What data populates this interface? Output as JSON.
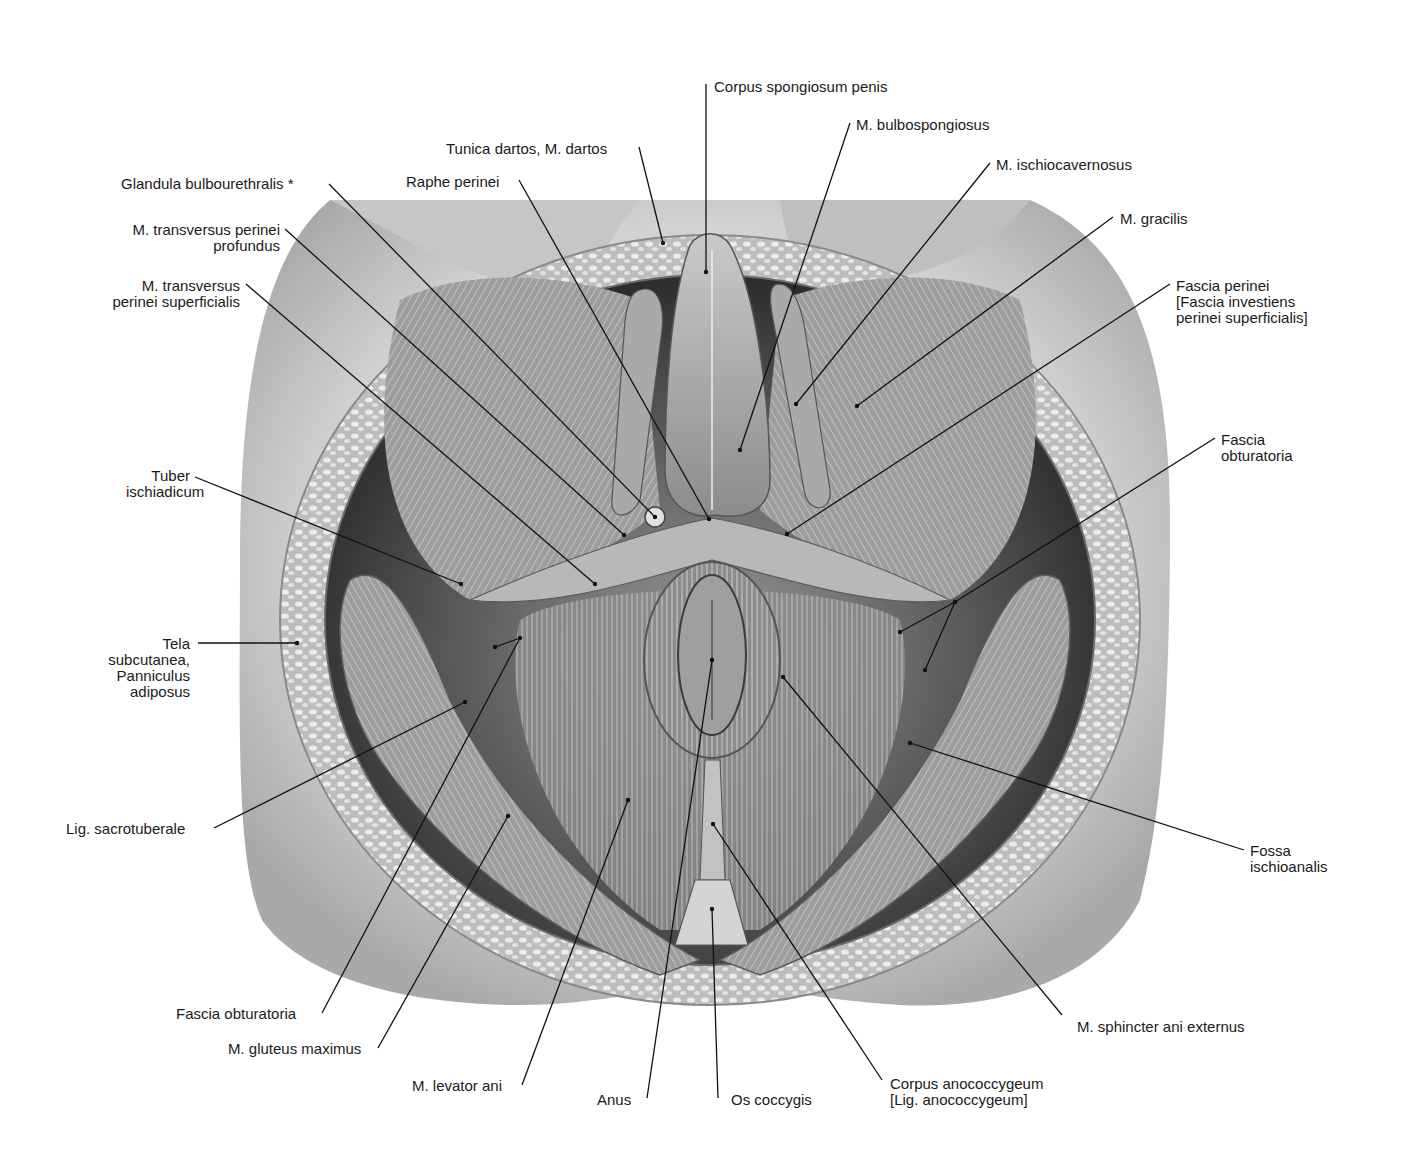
{
  "figure": {
    "colors": {
      "background": "#ffffff",
      "text": "#1a1a1a",
      "leader": "#111111",
      "skin": "#b8b8b8",
      "fat": "#d8d8d8",
      "muscle": "#8a8a8a",
      "deep": "#3a3a3a"
    }
  },
  "labels": [
    {
      "id": "corpus-spongiosum-penis",
      "text": "Corpus spongiosum penis",
      "x": 714,
      "y": 79,
      "align": "left",
      "line": [
        [
          706,
          84
        ],
        [
          706,
          272
        ]
      ]
    },
    {
      "id": "m-bulbospongiosus",
      "text": "M. bulbospongiosus",
      "x": 856,
      "y": 117,
      "align": "left",
      "line": [
        [
          850,
          123
        ],
        [
          740,
          450
        ]
      ]
    },
    {
      "id": "tunica-dartos",
      "text": "Tunica dartos, M. dartos",
      "x": 446,
      "y": 141,
      "align": "left",
      "line": [
        [
          639,
          147
        ],
        [
          663,
          243
        ]
      ]
    },
    {
      "id": "m-ischiocavernosus",
      "text": "M. ischiocavernosus",
      "x": 996,
      "y": 157,
      "align": "left",
      "line": [
        [
          990,
          163
        ],
        [
          796,
          404
        ]
      ]
    },
    {
      "id": "glandula-bulbourethralis",
      "text": "Glandula bulbourethralis *",
      "x": 121,
      "y": 176,
      "align": "left",
      "line": [
        [
          329,
          184
        ],
        [
          655,
          517
        ]
      ]
    },
    {
      "id": "raphe-perinei",
      "text": "Raphe perinei",
      "x": 406,
      "y": 174,
      "align": "left",
      "line": [
        [
          519,
          180
        ],
        [
          709,
          519
        ]
      ]
    },
    {
      "id": "m-gracilis",
      "text": "M. gracilis",
      "x": 1120,
      "y": 211,
      "align": "left",
      "line": [
        [
          1113,
          217
        ],
        [
          857,
          406
        ]
      ]
    },
    {
      "id": "m-transversus-perinei-profundus",
      "text": "M. transversus perinei\nprofundus",
      "x": 110,
      "y": 222,
      "align": "right",
      "w": 170,
      "line": [
        [
          285,
          229
        ],
        [
          624,
          535
        ]
      ]
    },
    {
      "id": "fascia-perinei",
      "text": "Fascia perinei\n[Fascia investiens\nperinei superficialis]",
      "x": 1176,
      "y": 278,
      "align": "left",
      "line": [
        [
          1170,
          284
        ],
        [
          787,
          534
        ]
      ]
    },
    {
      "id": "m-transversus-perinei-superficialis",
      "text": "M. transversus\nperinei superficialis",
      "x": 92,
      "y": 278,
      "align": "right",
      "w": 148,
      "line": [
        [
          246,
          284
        ],
        [
          595,
          584
        ]
      ]
    },
    {
      "id": "fascia-obturatoria-right",
      "text": "Fascia\nobturatoria",
      "x": 1221,
      "y": 432,
      "align": "left",
      "line": [
        [
          1215,
          438
        ],
        [
          955,
          602
        ]
      ],
      "extra_lines": [
        [
          [
            955,
            602
          ],
          [
            900,
            632
          ]
        ],
        [
          [
            955,
            602
          ],
          [
            925,
            670
          ]
        ]
      ]
    },
    {
      "id": "tuber-ischiadicum",
      "text": "Tuber\nischiadicum",
      "x": 126,
      "y": 468,
      "align": "right",
      "w": 64,
      "line": [
        [
          195,
          477
        ],
        [
          461,
          584
        ]
      ]
    },
    {
      "id": "tela-subcutanea",
      "text": "Tela\nsubcutanea,\nPanniculus\nadiposus",
      "x": 95,
      "y": 636,
      "align": "right",
      "w": 95,
      "line": [
        [
          198,
          643
        ],
        [
          297,
          643
        ]
      ]
    },
    {
      "id": "lig-sacrotuberale",
      "text": "Lig. sacrotuberale",
      "x": 66,
      "y": 821,
      "align": "left",
      "line": [
        [
          214,
          828
        ],
        [
          465,
          702
        ]
      ]
    },
    {
      "id": "fossa-ischioanalis",
      "text": "Fossa\nischioanalis",
      "x": 1250,
      "y": 843,
      "align": "left",
      "line": [
        [
          1244,
          850
        ],
        [
          910,
          743
        ]
      ]
    },
    {
      "id": "fascia-obturatoria-left",
      "text": "Fascia obturatoria",
      "x": 176,
      "y": 1006,
      "align": "left",
      "line": [
        [
          322,
          1013
        ],
        [
          520,
          638
        ]
      ],
      "extra_lines": [
        [
          [
            520,
            638
          ],
          [
            495,
            647
          ]
        ]
      ]
    },
    {
      "id": "m-sphincter-ani-externus",
      "text": "M. sphincter ani externus",
      "x": 1077,
      "y": 1019,
      "align": "left",
      "line": [
        [
          1062,
          1015
        ],
        [
          783,
          677
        ]
      ]
    },
    {
      "id": "m-gluteus-maximus",
      "text": "M. gluteus maximus",
      "x": 228,
      "y": 1041,
      "align": "left",
      "line": [
        [
          378,
          1048
        ],
        [
          508,
          816
        ]
      ]
    },
    {
      "id": "m-levator-ani",
      "text": "M. levator ani",
      "x": 412,
      "y": 1078,
      "align": "left",
      "line": [
        [
          522,
          1085
        ],
        [
          628,
          800
        ]
      ]
    },
    {
      "id": "anus",
      "text": "Anus",
      "x": 597,
      "y": 1092,
      "align": "left",
      "line": [
        [
          647,
          1098
        ],
        [
          712,
          660
        ]
      ]
    },
    {
      "id": "os-coccygis",
      "text": "Os coccygis",
      "x": 731,
      "y": 1092,
      "align": "left",
      "line": [
        [
          718,
          1098
        ],
        [
          712,
          909
        ]
      ]
    },
    {
      "id": "corpus-anococcygeum",
      "text": "Corpus anococcygeum\n[Lig. anococcygeum]",
      "x": 890,
      "y": 1076,
      "align": "left",
      "line": [
        [
          882,
          1080
        ],
        [
          713,
          824
        ]
      ]
    }
  ]
}
